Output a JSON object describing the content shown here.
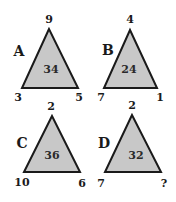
{
  "puzzle": {
    "fill_color": "#c8c8c8",
    "stroke_color": "#1a1a1a",
    "triangles": [
      {
        "letter": "A",
        "top": "9",
        "left": "3",
        "right": "5",
        "center": "34"
      },
      {
        "letter": "B",
        "top": "4",
        "left": "7",
        "right": "1",
        "center": "24"
      },
      {
        "letter": "C",
        "top": "2",
        "left": "10",
        "right": "6",
        "center": "36"
      },
      {
        "letter": "D",
        "top": "2",
        "left": "7",
        "right": "?",
        "center": "32"
      }
    ]
  }
}
